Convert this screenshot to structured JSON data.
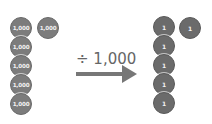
{
  "left_group": {
    "coin_value": "1,000",
    "column": [
      "1,000",
      "1,000",
      "1,000",
      "1,000",
      "1,000"
    ],
    "extra": "1,000",
    "count": 6
  },
  "operation": {
    "label": "÷ 1,000",
    "icon": "right-arrow-icon"
  },
  "right_group": {
    "coin_value": "1",
    "column": [
      "1",
      "1",
      "1",
      "1",
      "1"
    ],
    "extra": "1",
    "count": 6
  },
  "colors": {
    "coin_left": "#7c7c7c",
    "coin_right": "#6b6b6b",
    "arrow": "#777777",
    "text": "#666666"
  }
}
